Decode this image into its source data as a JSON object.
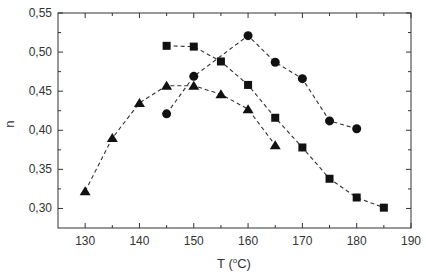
{
  "chart_data": {
    "type": "line",
    "title": "",
    "xlabel": "T (°C)",
    "ylabel": "n",
    "xlim": [
      125,
      190
    ],
    "ylim": [
      0.275,
      0.55
    ],
    "xticks": [
      130,
      140,
      150,
      160,
      170,
      180,
      190
    ],
    "xtick_labels": [
      "130",
      "140",
      "150",
      "160",
      "170",
      "180",
      "190"
    ],
    "yticks": [
      0.3,
      0.35,
      0.4,
      0.45,
      0.5,
      0.55
    ],
    "ytick_labels": [
      "0,30",
      "0,35",
      "0,40",
      "0,45",
      "0,50",
      "0,55"
    ],
    "grid": false,
    "legend": "none",
    "series": [
      {
        "name": "squares",
        "marker": "square",
        "line": "dashed",
        "x": [
          145,
          150,
          155,
          160,
          165,
          170,
          175,
          180,
          185
        ],
        "y": [
          0.508,
          0.507,
          0.488,
          0.458,
          0.416,
          0.378,
          0.338,
          0.314,
          0.301
        ]
      },
      {
        "name": "circles",
        "marker": "circle",
        "line": "dashed",
        "x": [
          145,
          150,
          160,
          165,
          170,
          175,
          180
        ],
        "y": [
          0.421,
          0.469,
          0.521,
          0.487,
          0.466,
          0.412,
          0.402
        ]
      },
      {
        "name": "triangles",
        "marker": "triangle",
        "line": "dashed",
        "x": [
          130,
          135,
          140,
          145,
          150,
          155,
          160,
          165
        ],
        "y": [
          0.322,
          0.39,
          0.435,
          0.457,
          0.457,
          0.446,
          0.427,
          0.381
        ]
      }
    ]
  },
  "labels": {
    "xlabel": "T (°C)",
    "ylabel": "n"
  }
}
